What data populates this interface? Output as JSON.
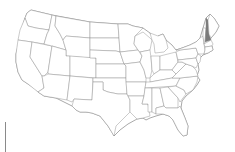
{
  "map": {
    "region": "United States (contiguous)",
    "highlighted_states": [
      "New Hampshire"
    ],
    "colors": {
      "state_fill": "#ffffff",
      "state_stroke": "#8a8a8a",
      "highlight_fill": "#7a7a7a",
      "background": "#ffffff"
    }
  }
}
